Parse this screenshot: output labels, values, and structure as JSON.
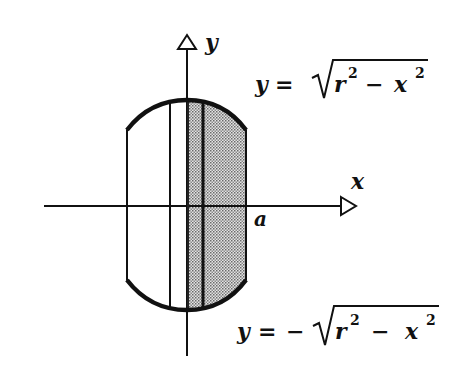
{
  "diagram": {
    "type": "cross-section of circular disk (washer/shell method)",
    "axes": {
      "x_label": "x",
      "y_label": "y"
    },
    "point_labels": {
      "a": "a"
    },
    "equations": {
      "upper": {
        "lhs": "y",
        "eq": "=",
        "sign": "",
        "radicand_r": "r",
        "exp_r": "2",
        "minus": "−",
        "radicand_x": "x",
        "exp_x": "2"
      },
      "lower": {
        "lhs": "y",
        "eq": "=",
        "sign": "−",
        "radicand_r": "r",
        "exp_r": "2",
        "minus": "−",
        "radicand_x": "x",
        "exp_x": "2"
      }
    },
    "colors": {
      "stroke": "#111111",
      "shade": "#bdbdbd",
      "background": "#ffffff"
    }
  }
}
